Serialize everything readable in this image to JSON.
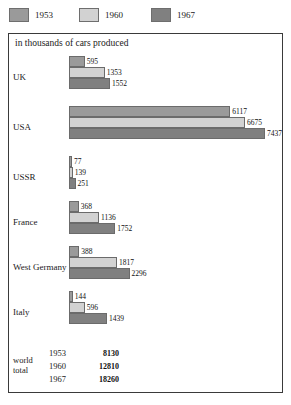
{
  "legend": {
    "items": [
      {
        "label": "1953",
        "color": "#9a9a9a",
        "icon": "legend-swatch-1953"
      },
      {
        "label": "1960",
        "color": "#d2d2d2",
        "icon": "legend-swatch-1960"
      },
      {
        "label": "1967",
        "color": "#808080",
        "icon": "legend-swatch-1967"
      }
    ]
  },
  "caption": "in thousands of cars produced",
  "world_total": {
    "label_line1": "world",
    "label_line2": "total",
    "rows": [
      {
        "year": "1953",
        "value": "8130"
      },
      {
        "year": "1960",
        "value": "12810"
      },
      {
        "year": "1967",
        "value": "18260"
      }
    ]
  },
  "chart_data": {
    "type": "bar",
    "orientation": "horizontal",
    "title": "in thousands of cars produced",
    "xlabel": "",
    "ylabel": "",
    "grid": false,
    "legend_position": "top",
    "xlim": [
      0,
      7437
    ],
    "categories": [
      "UK",
      "USA",
      "USSR",
      "France",
      "West Germany",
      "Italy"
    ],
    "series": [
      {
        "name": "1953",
        "color": "#9a9a9a",
        "values": [
          595,
          6117,
          77,
          368,
          388,
          144
        ]
      },
      {
        "name": "1960",
        "color": "#d2d2d2",
        "values": [
          1353,
          6675,
          139,
          1136,
          1817,
          596
        ]
      },
      {
        "name": "1967",
        "color": "#808080",
        "values": [
          1552,
          7437,
          251,
          1752,
          2296,
          1439
        ]
      }
    ],
    "totals": {
      "1953": 8130,
      "1960": 12810,
      "1967": 18260
    },
    "units": "thousands of cars produced"
  }
}
